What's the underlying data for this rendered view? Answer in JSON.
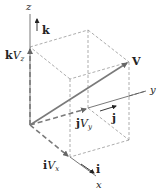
{
  "diagram": {
    "axes": {
      "x_label": "x",
      "y_label": "y",
      "z_label": "z"
    },
    "unit_vectors": {
      "i": "i",
      "j": "j",
      "k": "k"
    },
    "vector_label": "V",
    "components": {
      "x": {
        "unit": "i",
        "mag": "V",
        "sub": "x"
      },
      "y": {
        "unit": "j",
        "mag": "V",
        "sub": "y"
      },
      "z": {
        "unit": "k",
        "mag": "V",
        "sub": "z"
      }
    },
    "colors": {
      "vector": "#7a7a7a",
      "dashed": "#8a8a8a",
      "axis": "#555555",
      "text": "#222222"
    }
  }
}
